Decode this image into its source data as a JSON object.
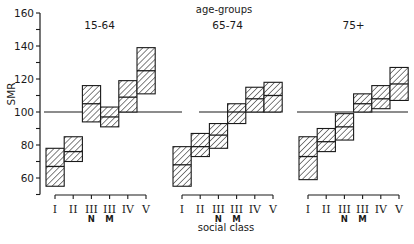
{
  "chart_data": {
    "type": "bar",
    "subtype": "box-range",
    "title": "age-groups",
    "xlabel": "social class",
    "ylabel": "SMR",
    "ylim": [
      50,
      160
    ],
    "yticks": [
      60,
      80,
      100,
      120,
      140,
      160
    ],
    "yminor_step": 10,
    "reference_line": 100,
    "grid": false,
    "categories": [
      "I",
      "II",
      "III N",
      "III M",
      "IV",
      "V"
    ],
    "category_labels": [
      {
        "main": "I",
        "sub": ""
      },
      {
        "main": "II",
        "sub": ""
      },
      {
        "main": "III",
        "sub": "N"
      },
      {
        "main": "III",
        "sub": "M"
      },
      {
        "main": "IV",
        "sub": ""
      },
      {
        "main": "V",
        "sub": ""
      }
    ],
    "panels": [
      {
        "name": "15-64",
        "series": {
          "upper": [
            78,
            85,
            116,
            103,
            119,
            139
          ],
          "estimate": [
            67,
            76,
            105,
            97,
            109,
            125
          ],
          "lower": [
            55,
            70,
            94,
            91,
            100,
            111
          ]
        }
      },
      {
        "name": "65-74",
        "series": {
          "upper": [
            79,
            87,
            93,
            105,
            115,
            118
          ],
          "estimate": [
            68,
            79,
            86,
            100,
            108,
            110
          ],
          "lower": [
            55,
            73,
            78,
            93,
            100,
            100
          ]
        }
      },
      {
        "name": "75+",
        "series": {
          "upper": [
            85,
            90,
            99,
            111,
            116,
            127
          ],
          "estimate": [
            73,
            82,
            91,
            105,
            108,
            117
          ],
          "lower": [
            59,
            76,
            83,
            100,
            102,
            107
          ]
        }
      }
    ]
  },
  "colors": {
    "ink": "#1a1a1a",
    "background": "#ffffff"
  }
}
